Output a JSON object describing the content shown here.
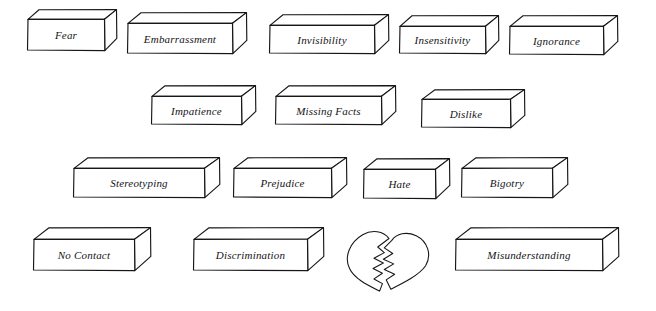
{
  "figure": {
    "kind": "wall-of-bricks-diagram",
    "background_color": "#ffffff",
    "ink_color": "#17171a",
    "rows": [
      {
        "row_label": "row-1"
      },
      {
        "row_label": "row-2"
      },
      {
        "row_label": "row-3"
      },
      {
        "row_label": "row-4"
      }
    ]
  },
  "bricks": [
    {
      "label": "Fear",
      "row": 1,
      "x": 28,
      "y": 20,
      "w": 76,
      "h": 30,
      "depth_x": 12,
      "depth_y": 11,
      "font_size": 11
    },
    {
      "label": "Embarrassment",
      "row": 1,
      "x": 128,
      "y": 24,
      "w": 104,
      "h": 29,
      "depth_x": 14,
      "depth_y": 12,
      "font_size": 11
    },
    {
      "label": "Invisibility",
      "row": 1,
      "x": 270,
      "y": 26,
      "w": 104,
      "h": 27,
      "depth_x": 14,
      "depth_y": 12,
      "font_size": 11
    },
    {
      "label": "Insensitivity",
      "row": 1,
      "x": 400,
      "y": 27,
      "w": 85,
      "h": 26,
      "depth_x": 13,
      "depth_y": 12,
      "font_size": 11
    },
    {
      "label": "Ignorance",
      "row": 1,
      "x": 510,
      "y": 27,
      "w": 93,
      "h": 27,
      "depth_x": 14,
      "depth_y": 12,
      "font_size": 11
    },
    {
      "label": "Impatience",
      "row": 2,
      "x": 152,
      "y": 97,
      "w": 89,
      "h": 27,
      "depth_x": 14,
      "depth_y": 12,
      "font_size": 11
    },
    {
      "label": "Missing Facts",
      "row": 2,
      "x": 276,
      "y": 97,
      "w": 105,
      "h": 27,
      "depth_x": 14,
      "depth_y": 12,
      "font_size": 11
    },
    {
      "label": "Dislike",
      "row": 2,
      "x": 422,
      "y": 100,
      "w": 88,
      "h": 27,
      "depth_x": 14,
      "depth_y": 11,
      "font_size": 11
    },
    {
      "label": "Stereotyping",
      "row": 3,
      "x": 74,
      "y": 169,
      "w": 130,
      "h": 28,
      "depth_x": 15,
      "depth_y": 12,
      "font_size": 11
    },
    {
      "label": "Prejudice",
      "row": 3,
      "x": 234,
      "y": 169,
      "w": 97,
      "h": 28,
      "depth_x": 15,
      "depth_y": 12,
      "font_size": 11
    },
    {
      "label": "Hate",
      "row": 3,
      "x": 364,
      "y": 170,
      "w": 71,
      "h": 28,
      "depth_x": 14,
      "depth_y": 12,
      "font_size": 11
    },
    {
      "label": "Bigotry",
      "row": 3,
      "x": 462,
      "y": 169,
      "w": 90,
      "h": 28,
      "depth_x": 15,
      "depth_y": 12,
      "font_size": 11
    },
    {
      "label": "No Contact",
      "row": 4,
      "x": 34,
      "y": 240,
      "w": 100,
      "h": 30,
      "depth_x": 16,
      "depth_y": 13,
      "font_size": 11
    },
    {
      "label": "Discrimination",
      "row": 4,
      "x": 194,
      "y": 240,
      "w": 113,
      "h": 30,
      "depth_x": 16,
      "depth_y": 13,
      "font_size": 11
    },
    {
      "label": "Misunderstanding",
      "row": 4,
      "x": 456,
      "y": 240,
      "w": 146,
      "h": 30,
      "depth_x": 16,
      "depth_y": 13,
      "font_size": 11
    }
  ],
  "heart": {
    "name": "broken-heart",
    "x": 342,
    "y": 231,
    "width": 94,
    "height": 62
  }
}
